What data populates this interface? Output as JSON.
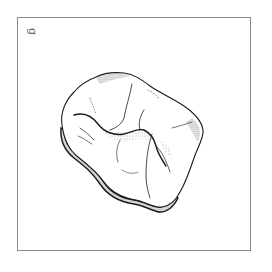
{
  "figure": {
    "panel_label": "g",
    "colors": {
      "ink": "#1a1a1a",
      "frame": "#8a8a8a",
      "label": "#555555",
      "background": "#ffffff"
    }
  }
}
